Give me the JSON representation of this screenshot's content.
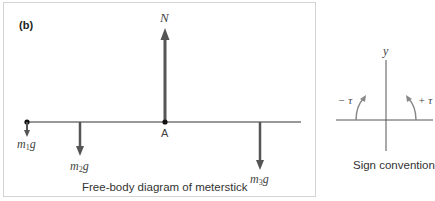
{
  "panel_label": "(b)",
  "free_body": {
    "caption": "Free-body diagram of meterstick",
    "normal_force": "N",
    "pivot_label": "A",
    "forces": [
      {
        "name": "m",
        "sub": "1",
        "g": "g"
      },
      {
        "name": "m",
        "sub": "2",
        "g": "g"
      },
      {
        "name": "m",
        "sub": "3",
        "g": "g"
      }
    ]
  },
  "sign_convention": {
    "caption": "Sign convention",
    "axis_label": "y",
    "negative": "− τ",
    "positive": "+ τ"
  },
  "colors": {
    "arrow": "#555555",
    "line": "#333333",
    "border": "#d4d4d4"
  }
}
